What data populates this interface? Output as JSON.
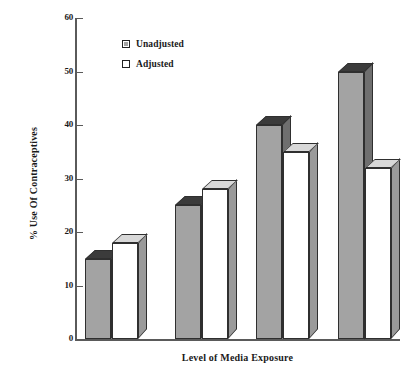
{
  "chart_data": {
    "type": "bar",
    "title": "",
    "subtitle": "",
    "xlabel": "Level of Media Exposure",
    "ylabel": "% Use Of Contraceptives",
    "ylim": [
      0,
      60
    ],
    "y_ticks": [
      0,
      10,
      20,
      30,
      40,
      50,
      60
    ],
    "y_tick_labels": [
      "0",
      "10",
      "20",
      "30",
      "40",
      "50",
      "60"
    ],
    "x_tick_labels": [
      "",
      "",
      "",
      ""
    ],
    "categories": [
      "1",
      "2",
      "3",
      "4"
    ],
    "grid": false,
    "legend_position": "upper-left-inside",
    "style": "3d-bar",
    "series": [
      {
        "name": "Unadjusted",
        "color": "#a3a3a3",
        "values": [
          15,
          25,
          40,
          50
        ]
      },
      {
        "name": "Adjusted",
        "color": "#ffffff",
        "values": [
          18,
          28,
          35,
          32
        ]
      }
    ],
    "annotations": []
  },
  "legend": {
    "items": [
      {
        "label": "Unadjusted",
        "swatch": "gray-hatched-swatch"
      },
      {
        "label": "Adjusted",
        "swatch": "white-swatch"
      }
    ]
  },
  "axes": {
    "y_title": "% Use Of Contraceptives",
    "x_title": "Level of Media Exposure",
    "y_labels": [
      "60",
      "50",
      "40",
      "30",
      "20",
      "10",
      "0"
    ]
  },
  "colors": {
    "bar_unadjusted_face": "#a3a3a3",
    "bar_unadjusted_top": "#3b3b3b",
    "bar_unadjusted_side": "#6f6f6f",
    "bar_adjusted_face": "#ffffff",
    "bar_adjusted_top": "#d8d8d8",
    "bar_adjusted_side": "#9a9a9a",
    "axis": "#5a5a5a",
    "text": "#1a1a1a",
    "background": "#ffffff"
  }
}
